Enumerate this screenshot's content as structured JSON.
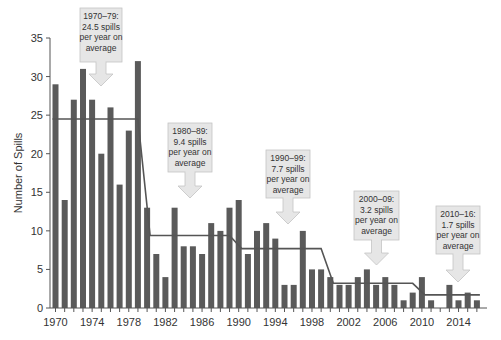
{
  "chart_data": {
    "type": "bar",
    "title": "",
    "xlabel": "",
    "ylabel": "Number of Spills",
    "ylim": [
      0,
      35
    ],
    "yticks": [
      0,
      5,
      10,
      15,
      20,
      25,
      30,
      35
    ],
    "xtick_labels": [
      "1970",
      "1974",
      "1978",
      "1982",
      "1986",
      "1990",
      "1994",
      "1998",
      "2002",
      "2006",
      "2010",
      "2014"
    ],
    "grid": false,
    "legend": null,
    "categories": [
      1970,
      1971,
      1972,
      1973,
      1974,
      1975,
      1976,
      1977,
      1978,
      1979,
      1980,
      1981,
      1982,
      1983,
      1984,
      1985,
      1986,
      1987,
      1988,
      1989,
      1990,
      1991,
      1992,
      1993,
      1994,
      1995,
      1996,
      1997,
      1998,
      1999,
      2000,
      2001,
      2002,
      2003,
      2004,
      2005,
      2006,
      2007,
      2008,
      2009,
      2010,
      2011,
      2012,
      2013,
      2014,
      2015,
      2016
    ],
    "values": [
      29,
      14,
      27,
      31,
      27,
      20,
      26,
      16,
      23,
      32,
      13,
      7,
      4,
      13,
      8,
      8,
      7,
      11,
      10,
      13,
      14,
      7,
      10,
      11,
      9,
      3,
      3,
      10,
      5,
      5,
      4,
      3,
      3,
      4,
      5,
      3,
      4,
      3,
      1,
      2,
      4,
      1,
      0,
      3,
      1,
      2,
      1
    ],
    "bar_color": "#5a5a5a",
    "average_line": {
      "color": "#555555",
      "segments": [
        {
          "period": "1970-79",
          "start": 1970,
          "end": 1979,
          "value": 24.5
        },
        {
          "period": "1980-89",
          "start": 1980,
          "end": 1989,
          "value": 9.4
        },
        {
          "period": "1990-99",
          "start": 1990,
          "end": 1999,
          "value": 7.7
        },
        {
          "period": "2000-09",
          "start": 2000,
          "end": 2009,
          "value": 3.2
        },
        {
          "period": "2010-16",
          "start": 2010,
          "end": 2016,
          "value": 1.7
        }
      ]
    },
    "annotations": [
      {
        "lines": [
          "1970–79:",
          "24.5 spills",
          "per year on",
          "average"
        ],
        "box": [
          80,
          8,
          42,
          54
        ],
        "arrow_tip_y": 86
      },
      {
        "lines": [
          "1980–89:",
          "9.4 spills",
          "per year on",
          "average"
        ],
        "box": [
          168,
          123,
          44,
          49
        ],
        "arrow_tip_y": 198
      },
      {
        "lines": [
          "1990–99:",
          "7.7 spills",
          "per year on",
          "average"
        ],
        "box": [
          266,
          150,
          44,
          48
        ],
        "arrow_tip_y": 224
      },
      {
        "lines": [
          "2000–09:",
          "3.2 spills",
          "per year on",
          "average"
        ],
        "box": [
          354,
          191,
          45,
          49
        ],
        "arrow_tip_y": 265
      },
      {
        "lines": [
          "2010–16:",
          "1.7 spills",
          "per year on",
          "average"
        ],
        "box": [
          436,
          206,
          44,
          48
        ],
        "arrow_tip_y": 282
      }
    ],
    "callout_fill": "#e6e6e6",
    "callout_stroke": "#c4c4c4"
  }
}
